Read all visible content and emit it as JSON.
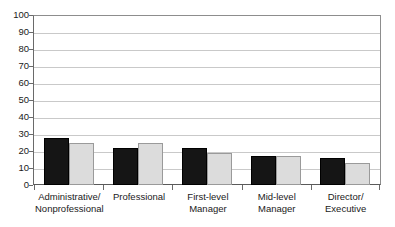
{
  "chart_data": {
    "type": "bar",
    "title": "",
    "subtitle": "",
    "xlabel": "",
    "ylabel": "",
    "ylim": [
      0,
      100
    ],
    "yticks": [
      0,
      10,
      20,
      30,
      40,
      50,
      60,
      70,
      80,
      90,
      100
    ],
    "ytick_labels": [
      "0",
      "10",
      "20",
      "30",
      "40",
      "50",
      "60",
      "70",
      "80",
      "90",
      "100"
    ],
    "grid": "horizontal",
    "legend": "none",
    "orientation": "vertical",
    "grouping": "clustered",
    "categories": [
      "Administrative/\nNonprofessional",
      "Professional",
      "First-level\nManager",
      "Mid-level\nManager",
      "Director/\nExecutive"
    ],
    "series": [
      {
        "name": "series-1",
        "color": "#151515",
        "values": [
          27.5,
          21.5,
          22.0,
          17.0,
          16.0
        ]
      },
      {
        "name": "series-2",
        "color": "#dcdcdc",
        "values": [
          25.0,
          24.5,
          19.0,
          17.0,
          13.0
        ]
      }
    ]
  },
  "axis": {
    "y_axis_color": "#6a6a6a",
    "grid_color": "#c9c9c9",
    "frame_color": "#8d8d8d"
  }
}
